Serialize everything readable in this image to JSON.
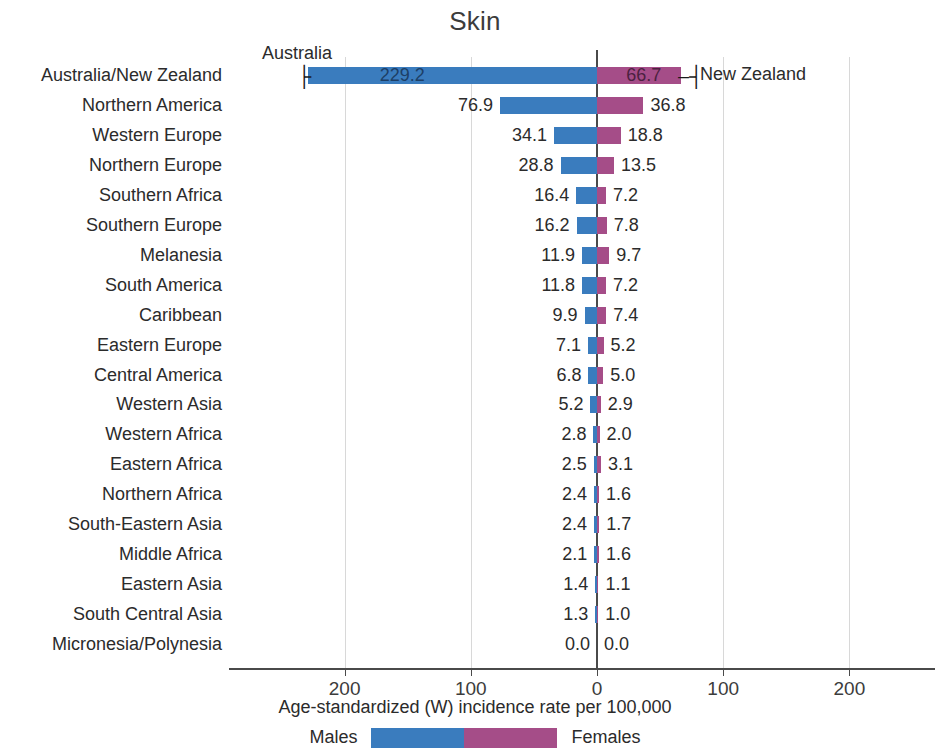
{
  "chart_data": {
    "type": "bar",
    "title": "Skin",
    "xlabel": "Age-standardized (W) incidence rate per 100,000",
    "ylabel": "",
    "orientation": "horizontal-diverging",
    "grid": true,
    "legend_position": "bottom",
    "xlim": [
      -260,
      260
    ],
    "xticks": [
      "200",
      "100",
      "0",
      "100",
      "200"
    ],
    "xtick_values": [
      -200,
      -100,
      0,
      100,
      200
    ],
    "categories": [
      "Australia/New Zealand",
      "Northern America",
      "Western Europe",
      "Northern Europe",
      "Southern Africa",
      "Southern Europe",
      "Melanesia",
      "South America",
      "Caribbean",
      "Eastern Europe",
      "Central America",
      "Western Asia",
      "Western Africa",
      "Eastern Africa",
      "Northern Africa",
      "South-Eastern Asia",
      "Middle Africa",
      "Eastern Asia",
      "South Central Asia",
      "Micronesia/Polynesia"
    ],
    "series": [
      {
        "name": "Males",
        "color": "#3A7CBE",
        "values": [
          229.2,
          76.9,
          34.1,
          28.8,
          16.4,
          16.2,
          11.9,
          11.8,
          9.9,
          7.1,
          6.8,
          5.2,
          2.8,
          2.5,
          2.4,
          2.4,
          2.1,
          1.4,
          1.3,
          0.0
        ],
        "labels": [
          "229.2",
          "76.9",
          "34.1",
          "28.8",
          "16.4",
          "16.2",
          "11.9",
          "11.8",
          "9.9",
          "7.1",
          "6.8",
          "5.2",
          "2.8",
          "2.5",
          "2.4",
          "2.4",
          "2.1",
          "1.4",
          "1.3",
          "0.0"
        ]
      },
      {
        "name": "Females",
        "color": "#A54D88",
        "values": [
          66.7,
          36.8,
          18.8,
          13.5,
          7.2,
          7.8,
          9.7,
          7.2,
          7.4,
          5.2,
          5.0,
          2.9,
          2.0,
          3.1,
          1.6,
          1.7,
          1.6,
          1.1,
          1.0,
          0.0
        ],
        "labels": [
          "66.7",
          "36.8",
          "18.8",
          "13.5",
          "7.2",
          "7.8",
          "9.7",
          "7.2",
          "7.4",
          "5.2",
          "5.0",
          "2.9",
          "2.0",
          "3.1",
          "1.6",
          "1.7",
          "1.6",
          "1.1",
          "1.0",
          "0.0"
        ]
      }
    ],
    "annotations": [
      {
        "text": "Australia",
        "row": 0,
        "side": "left"
      },
      {
        "text": "New Zealand",
        "row": 0,
        "side": "right"
      }
    ]
  },
  "legend": {
    "males_label": "Males",
    "females_label": "Females"
  }
}
